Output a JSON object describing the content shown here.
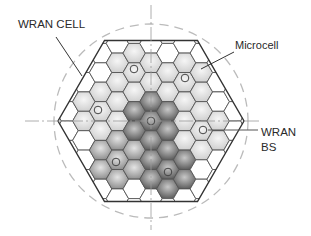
{
  "diagram": {
    "type": "hexagonal-cell-layout",
    "labels": {
      "wran_cell": "WRAN CELL",
      "microcell": "Microcell",
      "wran_bs_line1": "WRAN",
      "wran_bs_line2": "BS"
    },
    "center": [
      151,
      121
    ],
    "wran_cell_radius": 93,
    "coverage_circle_radius": 97,
    "microcell_radius": 11.2,
    "cluster_size": 7,
    "base_stations": [
      {
        "dx": 0,
        "dy": 0,
        "shade": "dark"
      },
      {
        "dx": -17,
        "dy": -52,
        "shade": "light"
      },
      {
        "dx": 34,
        "dy": -43,
        "shade": "light"
      },
      {
        "dx": -53,
        "dy": -11,
        "shade": "light"
      },
      {
        "dx": 52,
        "dy": 9,
        "shade": "light"
      },
      {
        "dx": -35,
        "dy": 41,
        "shade": "medium"
      },
      {
        "dx": 17,
        "dy": 51,
        "shade": "dark"
      }
    ],
    "colors": {
      "grid_line": "#555555",
      "outline": "#333333",
      "dashed": "#bbbbbb",
      "light_fill_center": "#f4f4f4",
      "light_fill_edge": "#cfcfcf",
      "medium_fill_center": "#e2e2e2",
      "medium_fill_edge": "#8a8a8a",
      "dark_fill_center": "#c4c4c4",
      "dark_fill_edge": "#555555"
    }
  }
}
